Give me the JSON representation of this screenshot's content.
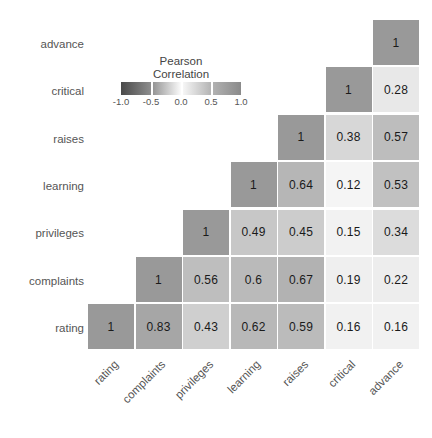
{
  "chart_data": {
    "type": "heatmap",
    "title": "",
    "xlabel": "",
    "ylabel": "",
    "variables": [
      "rating",
      "complaints",
      "privileges",
      "learning",
      "raises",
      "critical",
      "advance"
    ],
    "x_tick_labels": [
      "rating",
      "complaints",
      "privileges",
      "learning",
      "raises",
      "critical",
      "advance"
    ],
    "y_tick_labels": [
      "advance",
      "critical",
      "raises",
      "learning",
      "privileges",
      "complaints",
      "rating"
    ],
    "triangle": "lower",
    "colormap": "grayscale",
    "zlim": [
      -1.0,
      1.0
    ],
    "grid": false,
    "legend_position": "upper-left-inset",
    "rows": [
      {
        "label": "advance",
        "cells": [
          {
            "column": "advance",
            "value": 1,
            "text": "1",
            "color": "#999999"
          }
        ]
      },
      {
        "label": "critical",
        "cells": [
          {
            "column": "critical",
            "value": 1,
            "text": "1",
            "color": "#999999"
          },
          {
            "column": "advance",
            "value": 0.28,
            "text": "0.28",
            "color": "#e8e8e8"
          }
        ]
      },
      {
        "label": "raises",
        "cells": [
          {
            "column": "raises",
            "value": 1,
            "text": "1",
            "color": "#999999"
          },
          {
            "column": "critical",
            "value": 0.38,
            "text": "0.38",
            "color": "#d7d7d7"
          },
          {
            "column": "advance",
            "value": 0.57,
            "text": "0.57",
            "color": "#bdbdbd"
          }
        ]
      },
      {
        "label": "learning",
        "cells": [
          {
            "column": "learning",
            "value": 1,
            "text": "1",
            "color": "#999999"
          },
          {
            "column": "raises",
            "value": 0.64,
            "text": "0.64",
            "color": "#b6b6b6"
          },
          {
            "column": "critical",
            "value": 0.12,
            "text": "0.12",
            "color": "#f5f5f5"
          },
          {
            "column": "advance",
            "value": 0.53,
            "text": "0.53",
            "color": "#c1c1c1"
          }
        ]
      },
      {
        "label": "privileges",
        "cells": [
          {
            "column": "privileges",
            "value": 1,
            "text": "1",
            "color": "#999999"
          },
          {
            "column": "learning",
            "value": 0.49,
            "text": "0.49",
            "color": "#c7c7c7"
          },
          {
            "column": "raises",
            "value": 0.45,
            "text": "0.45",
            "color": "#cccccc"
          },
          {
            "column": "critical",
            "value": 0.15,
            "text": "0.15",
            "color": "#f2f2f2"
          },
          {
            "column": "advance",
            "value": 0.34,
            "text": "0.34",
            "color": "#dcdcdc"
          }
        ]
      },
      {
        "label": "complaints",
        "cells": [
          {
            "column": "complaints",
            "value": 1,
            "text": "1",
            "color": "#999999"
          },
          {
            "column": "privileges",
            "value": 0.56,
            "text": "0.56",
            "color": "#bebebe"
          },
          {
            "column": "learning",
            "value": 0.6,
            "text": "0.6",
            "color": "#bababa"
          },
          {
            "column": "raises",
            "value": 0.67,
            "text": "0.67",
            "color": "#b2b2b2"
          },
          {
            "column": "critical",
            "value": 0.19,
            "text": "0.19",
            "color": "#efefef"
          },
          {
            "column": "advance",
            "value": 0.22,
            "text": "0.22",
            "color": "#ededed"
          }
        ]
      },
      {
        "label": "rating",
        "cells": [
          {
            "column": "rating",
            "value": 1,
            "text": "1",
            "color": "#999999"
          },
          {
            "column": "complaints",
            "value": 0.83,
            "text": "0.83",
            "color": "#a6a6a6"
          },
          {
            "column": "privileges",
            "value": 0.43,
            "text": "0.43",
            "color": "#cfcfcf"
          },
          {
            "column": "learning",
            "value": 0.62,
            "text": "0.62",
            "color": "#b8b8b8"
          },
          {
            "column": "raises",
            "value": 0.59,
            "text": "0.59",
            "color": "#bbbbbb"
          },
          {
            "column": "critical",
            "value": 0.16,
            "text": "0.16",
            "color": "#f1f1f1"
          },
          {
            "column": "advance",
            "value": 0.16,
            "text": "0.16",
            "color": "#f1f1f1"
          }
        ]
      }
    ]
  },
  "legend": {
    "title_line1": "Pearson",
    "title_line2": "Correlation",
    "ticks": [
      "-1.0",
      "-0.5",
      "0.0",
      "0.5",
      "1.0"
    ],
    "tick_values": [
      -1.0,
      -0.5,
      0.0,
      0.5,
      1.0
    ],
    "min_color": "#4a4a4a",
    "mid_color": "#fbfbfb",
    "max_color": "#8a8a8a"
  }
}
